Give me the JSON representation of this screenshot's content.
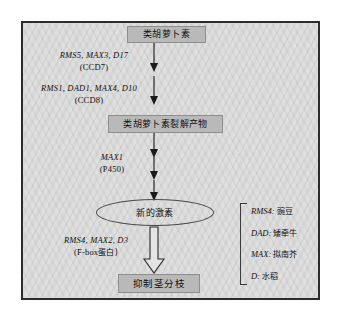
{
  "figure": {
    "title_absent": true,
    "frame": {
      "border_color": "#2c2c2c",
      "background_color": "#dcdcdc"
    },
    "nodes": [
      {
        "id": "carotenoid",
        "label": "类胡萝卜素",
        "shape": "box",
        "fill": "#b9b9b9"
      },
      {
        "id": "cleavage-product",
        "label": "类胡萝卜素裂解产物",
        "shape": "box",
        "fill": "#b9b9b9"
      },
      {
        "id": "new-hormone",
        "label": "新的激素",
        "shape": "ellipse",
        "fill": "none"
      },
      {
        "id": "inhibit-branching",
        "label": "抑制茎分枝",
        "shape": "box",
        "fill": "#b9b9b9"
      }
    ],
    "edge_labels": [
      {
        "id": "ccd7",
        "genes": "RMS5, MAX3, D17",
        "enzyme": "(CCD7)"
      },
      {
        "id": "ccd8",
        "genes": "RMS1, DAD1, MAX4, D10",
        "enzyme": "(CCD8)"
      },
      {
        "id": "p450",
        "genes": "MAX1",
        "enzyme": "(P450)"
      },
      {
        "id": "fbox",
        "genes": "RMS4, MAX2, D3",
        "enzyme_prefix": "(F-box",
        "enzyme_cn": "蛋白)"
      }
    ],
    "legend": {
      "items": [
        {
          "gene": "RMS4:",
          "species": "豌豆"
        },
        {
          "gene": "DAD:",
          "species": "矮牵牛"
        },
        {
          "gene": "MAX:",
          "species": "拟南芥"
        },
        {
          "gene": "D:",
          "species": "水稻"
        }
      ]
    }
  }
}
